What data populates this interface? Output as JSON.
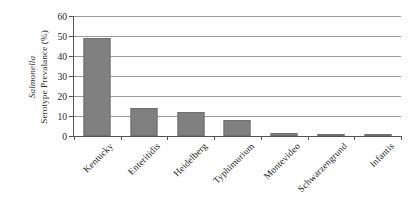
{
  "chart_data": {
    "type": "bar",
    "title": "",
    "subtitle": "",
    "xlabel": "",
    "ylabel_line1": "Salmonella",
    "ylabel_line2": "Serotype Prevalance (%)",
    "ylabel": "Salmonella Serotype Prevalance (%)",
    "categories": [
      "Kentucky",
      "Enteritidis",
      "Heidelberg",
      "Typhimurium",
      "Montevideo",
      "Schwarzengrund",
      "Infantis"
    ],
    "values": [
      49,
      14,
      12,
      8,
      1.6,
      1.0,
      0.7
    ],
    "ylim": [
      0,
      60
    ],
    "ytick_labels": [
      "60",
      "50",
      "40",
      "30",
      "20",
      "10",
      "0"
    ],
    "ytick_values": [
      60,
      50,
      40,
      30,
      20,
      10,
      0
    ],
    "ytick_step": 10,
    "grid": "horizontal",
    "legend": "none",
    "bar_color": "#808080",
    "bar_border_color": "#6f6f6f",
    "gridline_color": "#9a9a9a",
    "axis_color": "#555555",
    "background": "#ffffff",
    "xlabel_rotation_deg": -45
  }
}
